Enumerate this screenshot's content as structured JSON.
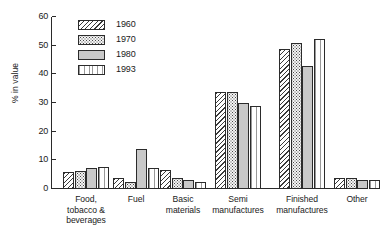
{
  "chart_data": {
    "type": "bar",
    "title": "",
    "xlabel": "",
    "ylabel": "% in value",
    "ylim": [
      0,
      60
    ],
    "yticks": [
      0,
      10,
      20,
      30,
      40,
      50,
      60
    ],
    "grid": false,
    "legend_position": "top-left",
    "categories": [
      "Food, tobacco & beverages",
      "Fuel",
      "Basic materials",
      "Semi manufactures",
      "Finished manufactures",
      "Other"
    ],
    "category_lines": [
      [
        "Food,",
        "tobacco &",
        "beverages"
      ],
      [
        "Fuel"
      ],
      [
        "Basic",
        "materials"
      ],
      [
        "Semi",
        "manufactures"
      ],
      [
        "Finished",
        "manufactures"
      ],
      [
        "Other"
      ]
    ],
    "series": [
      {
        "name": "1960",
        "pattern": "diagonal-hatch",
        "values": [
          6.0,
          4.0,
          6.5,
          33.8,
          49.0,
          3.8
        ]
      },
      {
        "name": "1970",
        "pattern": "dotted",
        "values": [
          6.3,
          2.5,
          4.0,
          33.8,
          51.0,
          3.7
        ]
      },
      {
        "name": "1980",
        "pattern": "solid-grey",
        "values": [
          7.5,
          13.8,
          3.0,
          30.0,
          43.0,
          3.3
        ]
      },
      {
        "name": "1993",
        "pattern": "fine-vertical",
        "values": [
          7.6,
          7.3,
          2.6,
          29.0,
          52.3,
          3.0
        ]
      }
    ]
  },
  "legend": {
    "entries": [
      {
        "label": "1960"
      },
      {
        "label": "1970"
      },
      {
        "label": "1980"
      },
      {
        "label": "1993"
      }
    ]
  },
  "axis": {
    "y_label": "% in value",
    "y_tick_labels": [
      "0",
      "10",
      "20",
      "30",
      "40",
      "50",
      "60"
    ]
  }
}
